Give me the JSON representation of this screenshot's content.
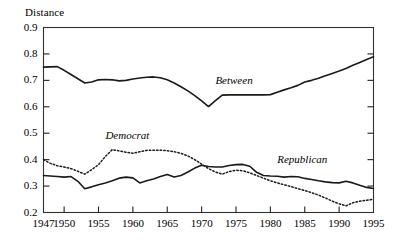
{
  "chart_data": {
    "type": "line",
    "title": "",
    "xlabel": "",
    "ylabel": "Distance",
    "xlim": [
      1947,
      1995
    ],
    "ylim": [
      0.2,
      0.9
    ],
    "grid": false,
    "legend_position": "inline-annotations",
    "xticks": [
      1947,
      1950,
      1955,
      1960,
      1965,
      1970,
      1975,
      1980,
      1985,
      1990,
      1995
    ],
    "xtick_labels": [
      "1947",
      "1950",
      "1955",
      "1960",
      "1965",
      "1970",
      "1975",
      "1980",
      "1985",
      "1990",
      "1995"
    ],
    "yticks": [
      0.2,
      0.3,
      0.4,
      0.5,
      0.6,
      0.7,
      0.8,
      0.9
    ],
    "ytick_labels": [
      "0.2",
      "0.3",
      "0.4",
      "0.5",
      "0.6",
      "0.7",
      "0.8",
      "0.9"
    ],
    "x": [
      1947,
      1948,
      1949,
      1950,
      1951,
      1952,
      1953,
      1954,
      1955,
      1956,
      1957,
      1958,
      1959,
      1960,
      1961,
      1962,
      1963,
      1964,
      1965,
      1966,
      1967,
      1968,
      1969,
      1970,
      1971,
      1972,
      1973,
      1974,
      1975,
      1976,
      1977,
      1978,
      1979,
      1980,
      1981,
      1982,
      1983,
      1984,
      1985,
      1986,
      1987,
      1988,
      1989,
      1990,
      1991,
      1992,
      1993,
      1994,
      1995
    ],
    "series": [
      {
        "name": "Between",
        "style": "solid",
        "color": "#1a1a1a",
        "label_x": 1972,
        "label_y": 0.695,
        "values": [
          0.75,
          0.751,
          0.752,
          0.738,
          0.722,
          0.706,
          0.69,
          0.694,
          0.702,
          0.703,
          0.702,
          0.698,
          0.7,
          0.705,
          0.709,
          0.712,
          0.713,
          0.71,
          0.702,
          0.69,
          0.676,
          0.66,
          0.642,
          0.622,
          0.601,
          0.623,
          0.644,
          0.645,
          0.645,
          0.645,
          0.645,
          0.645,
          0.645,
          0.646,
          0.655,
          0.664,
          0.672,
          0.681,
          0.694,
          0.7,
          0.708,
          0.717,
          0.726,
          0.735,
          0.745,
          0.757,
          0.768,
          0.779,
          0.789
        ]
      },
      {
        "name": "Democrat",
        "style": "dotted",
        "color": "#1a1a1a",
        "label_x": 1956,
        "label_y": 0.487,
        "values": [
          0.4,
          0.386,
          0.377,
          0.372,
          0.366,
          0.356,
          0.345,
          0.362,
          0.381,
          0.412,
          0.438,
          0.433,
          0.428,
          0.424,
          0.43,
          0.435,
          0.436,
          0.436,
          0.434,
          0.43,
          0.424,
          0.414,
          0.4,
          0.383,
          0.366,
          0.353,
          0.345,
          0.355,
          0.36,
          0.358,
          0.35,
          0.34,
          0.33,
          0.32,
          0.312,
          0.305,
          0.298,
          0.29,
          0.283,
          0.275,
          0.266,
          0.255,
          0.243,
          0.233,
          0.225,
          0.237,
          0.243,
          0.246,
          0.25
        ]
      },
      {
        "name": "Republican",
        "style": "solid",
        "color": "#1a1a1a",
        "label_x": 1981,
        "label_y": 0.395,
        "values": [
          0.34,
          0.338,
          0.336,
          0.334,
          0.336,
          0.318,
          0.29,
          0.297,
          0.305,
          0.312,
          0.32,
          0.33,
          0.334,
          0.331,
          0.312,
          0.32,
          0.327,
          0.336,
          0.344,
          0.334,
          0.34,
          0.353,
          0.368,
          0.379,
          0.374,
          0.372,
          0.372,
          0.378,
          0.381,
          0.382,
          0.375,
          0.352,
          0.34,
          0.338,
          0.337,
          0.334,
          0.336,
          0.335,
          0.329,
          0.325,
          0.32,
          0.316,
          0.313,
          0.312,
          0.318,
          0.312,
          0.303,
          0.295,
          0.291
        ]
      }
    ]
  },
  "axis": {
    "y_axis_title": "Distance"
  }
}
